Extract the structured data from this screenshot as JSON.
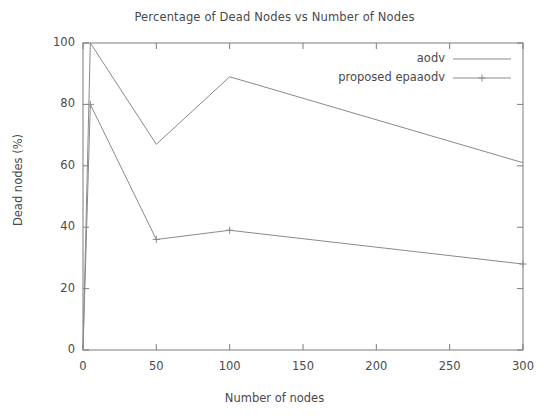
{
  "chart_data": {
    "type": "line",
    "title": "Percentage of Dead Nodes vs Number of Nodes",
    "xlabel": "Number of nodes",
    "ylabel": "Dead nodes (%)",
    "xlim": [
      0,
      300
    ],
    "ylim": [
      0,
      100
    ],
    "xticks": [
      "0",
      "50",
      "100",
      "150",
      "200",
      "250",
      "300"
    ],
    "xtick_values": [
      0,
      50,
      100,
      150,
      200,
      250,
      300
    ],
    "yticks": [
      "0",
      "20",
      "40",
      "60",
      "80",
      "100"
    ],
    "ytick_values": [
      0,
      20,
      40,
      60,
      80,
      100
    ],
    "grid": false,
    "legend_position": "top-right",
    "series": [
      {
        "name": "aodv",
        "marker": "none",
        "color": "#8a8a8a",
        "x": [
          0,
          5,
          50,
          100,
          300
        ],
        "values": [
          0,
          100,
          67,
          89,
          61
        ]
      },
      {
        "name": "proposed epaaodv",
        "marker": "plus",
        "color": "#8a8a8a",
        "x": [
          0,
          5,
          50,
          100,
          300
        ],
        "values": [
          0,
          80,
          36,
          39,
          28
        ]
      }
    ]
  },
  "legend": {
    "items": [
      {
        "label": "aodv",
        "marker": "none"
      },
      {
        "label": "proposed epaaodv",
        "marker": "plus"
      }
    ]
  },
  "axis": {
    "frame_color": "#7d7d7d"
  }
}
